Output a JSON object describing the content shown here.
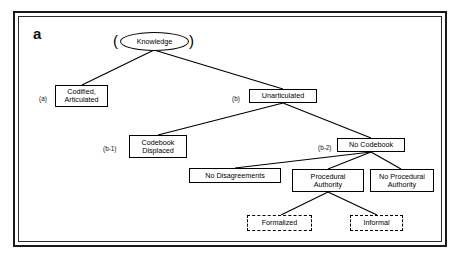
{
  "figure": {
    "panel_letter": "a",
    "frame": {
      "style": "double-rule-border",
      "color": "#1a1a1a"
    }
  },
  "diagram_data": {
    "type": "tree",
    "title": "Knowledge taxonomy hierarchy",
    "root": "knowledge",
    "nodes": [
      {
        "id": "knowledge",
        "label": "Knowledge",
        "shape": "ellipse",
        "tag": "",
        "level": 0
      },
      {
        "id": "codified",
        "label": "Codified, Articulated",
        "shape": "box",
        "tag": "(a)",
        "level": 1
      },
      {
        "id": "unarticulated",
        "label": "Unarticulated",
        "shape": "box",
        "tag": "(b)",
        "level": 1
      },
      {
        "id": "codebook-displaced",
        "label": "Codebook Displaced",
        "shape": "box",
        "tag": "(b-1)",
        "level": 2
      },
      {
        "id": "no-codebook",
        "label": "No Codebook",
        "shape": "box",
        "tag": "(b-2)",
        "level": 2
      },
      {
        "id": "no-disagreements",
        "label": "No Disagreements",
        "shape": "box",
        "tag": "",
        "level": 3
      },
      {
        "id": "procedural-authority",
        "label": "Procedural Authority",
        "shape": "box",
        "tag": "",
        "level": 3
      },
      {
        "id": "no-procedural-authority",
        "label": "No Procedural Authority",
        "shape": "box",
        "tag": "",
        "level": 3
      },
      {
        "id": "formalized",
        "label": "Formalized",
        "shape": "dashed-box",
        "tag": "",
        "level": 4
      },
      {
        "id": "informal",
        "label": "Informal",
        "shape": "dashed-box",
        "tag": "",
        "level": 4
      }
    ],
    "edges": [
      {
        "from": "knowledge",
        "to": "codified"
      },
      {
        "from": "knowledge",
        "to": "unarticulated"
      },
      {
        "from": "unarticulated",
        "to": "codebook-displaced"
      },
      {
        "from": "unarticulated",
        "to": "no-codebook"
      },
      {
        "from": "no-codebook",
        "to": "no-disagreements"
      },
      {
        "from": "no-codebook",
        "to": "procedural-authority"
      },
      {
        "from": "no-codebook",
        "to": "no-procedural-authority"
      },
      {
        "from": "procedural-authority",
        "to": "formalized"
      },
      {
        "from": "procedural-authority",
        "to": "informal"
      }
    ],
    "node_labels": {
      "knowledge": "Knowledge",
      "codified_line1": "Codified,",
      "codified_line2": "Articulated",
      "unarticulated": "Unarticulated",
      "codebook_line1": "Codebook",
      "codebook_line2": "Displaced",
      "no_codebook": "No Codebook",
      "no_disagreements": "No Disagreements",
      "procedural_line1": "Procedural",
      "procedural_line2": "Authority",
      "no_procedural_line1": "No Procedural",
      "no_procedural_line2": "Authority",
      "formalized": "Formalized",
      "informal": "Informal"
    },
    "tags": {
      "codified": "(a)",
      "unarticulated": "(b)",
      "codebook_displaced": "(b-1)",
      "no_codebook": "(b-2)"
    },
    "brackets": {
      "left": "(",
      "right": ")"
    }
  }
}
